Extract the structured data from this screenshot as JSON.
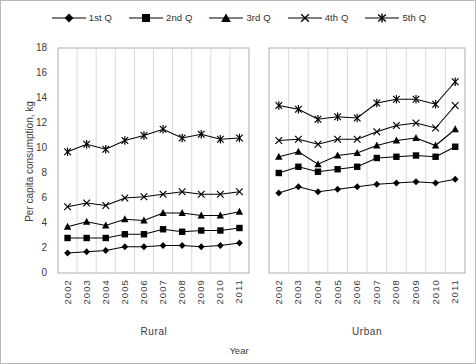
{
  "chart_data": {
    "type": "line",
    "title": "",
    "xlabel": "Year",
    "ylabel": "Per capita consumption, kg",
    "ylim": [
      0,
      18
    ],
    "ytick_values": [
      0,
      2,
      4,
      6,
      8,
      10,
      12,
      14,
      16,
      18
    ],
    "ytick_labels": [
      "0",
      "2",
      "4",
      "6",
      "8",
      "10",
      "12",
      "14",
      "16",
      "18"
    ],
    "grid": "vertical-only",
    "legend_position": "top-center",
    "groups": [
      {
        "name": "Rural",
        "categories": [
          "2002",
          "2003",
          "2004",
          "2005",
          "2006",
          "2007",
          "2008",
          "2009",
          "2010",
          "2011"
        ]
      },
      {
        "name": "Urban",
        "categories": [
          "2002",
          "2003",
          "2004",
          "2005",
          "2006",
          "2007",
          "2008",
          "2009",
          "2010",
          "2011"
        ]
      }
    ],
    "x": [
      "2002",
      "2003",
      "2004",
      "2005",
      "2006",
      "2007",
      "2008",
      "2009",
      "2010",
      "2011",
      "2002",
      "2003",
      "2004",
      "2005",
      "2006",
      "2007",
      "2008",
      "2009",
      "2010",
      "2011"
    ],
    "series": [
      {
        "name": "1st Q",
        "marker": "diamond",
        "rural": [
          1.6,
          1.7,
          1.8,
          2.1,
          2.1,
          2.2,
          2.2,
          2.1,
          2.2,
          2.4
        ],
        "urban": [
          6.4,
          6.9,
          6.5,
          6.7,
          6.9,
          7.1,
          7.2,
          7.3,
          7.2,
          7.5
        ],
        "values": [
          1.6,
          1.7,
          1.8,
          2.1,
          2.1,
          2.2,
          2.2,
          2.1,
          2.2,
          2.4,
          6.4,
          6.9,
          6.5,
          6.7,
          6.9,
          7.1,
          7.2,
          7.3,
          7.2,
          7.5
        ]
      },
      {
        "name": "2nd Q",
        "marker": "square",
        "rural": [
          2.8,
          2.8,
          2.8,
          3.1,
          3.1,
          3.5,
          3.3,
          3.4,
          3.4,
          3.6
        ],
        "urban": [
          8.0,
          8.5,
          8.1,
          8.3,
          8.5,
          9.2,
          9.3,
          9.4,
          9.3,
          10.1
        ],
        "values": [
          2.8,
          2.8,
          2.8,
          3.1,
          3.1,
          3.5,
          3.3,
          3.4,
          3.4,
          3.6,
          8.0,
          8.5,
          8.1,
          8.3,
          8.5,
          9.2,
          9.3,
          9.4,
          9.3,
          10.1
        ]
      },
      {
        "name": "3rd Q",
        "marker": "triangle",
        "rural": [
          3.7,
          4.1,
          3.8,
          4.3,
          4.2,
          4.8,
          4.8,
          4.6,
          4.6,
          4.9
        ],
        "urban": [
          9.3,
          9.7,
          8.7,
          9.4,
          9.6,
          10.2,
          10.6,
          10.8,
          10.2,
          11.5
        ],
        "values": [
          3.7,
          4.1,
          3.8,
          4.3,
          4.2,
          4.8,
          4.8,
          4.6,
          4.6,
          4.9,
          9.3,
          9.7,
          8.7,
          9.4,
          9.6,
          10.2,
          10.6,
          10.8,
          10.2,
          11.5
        ]
      },
      {
        "name": "4th Q",
        "marker": "x",
        "rural": [
          5.3,
          5.6,
          5.4,
          6.0,
          6.1,
          6.3,
          6.5,
          6.3,
          6.3,
          6.5
        ],
        "urban": [
          10.6,
          10.7,
          10.3,
          10.7,
          10.7,
          11.3,
          11.8,
          12.0,
          11.6,
          13.4
        ],
        "values": [
          5.3,
          5.6,
          5.4,
          6.0,
          6.1,
          6.3,
          6.5,
          6.3,
          6.3,
          6.5,
          10.6,
          10.7,
          10.3,
          10.7,
          10.7,
          11.3,
          11.8,
          12.0,
          11.6,
          13.4
        ]
      },
      {
        "name": "5th Q",
        "marker": "asterisk",
        "rural": [
          9.7,
          10.3,
          9.9,
          10.6,
          11.0,
          11.5,
          10.8,
          11.1,
          10.7,
          10.8
        ],
        "urban": [
          13.4,
          13.1,
          12.3,
          12.5,
          12.4,
          13.6,
          13.9,
          13.9,
          13.5,
          15.3
        ],
        "values": [
          9.7,
          10.3,
          9.9,
          10.6,
          11.0,
          11.5,
          10.8,
          11.1,
          10.7,
          10.8,
          13.4,
          13.1,
          12.3,
          12.5,
          12.4,
          13.6,
          13.9,
          13.9,
          13.5,
          15.3
        ]
      }
    ]
  },
  "legend": {
    "items": [
      {
        "label": "1st Q",
        "marker": "diamond"
      },
      {
        "label": "2nd Q",
        "marker": "square"
      },
      {
        "label": "3rd Q",
        "marker": "triangle"
      },
      {
        "label": "4th Q",
        "marker": "x"
      },
      {
        "label": "5th Q",
        "marker": "asterisk"
      }
    ]
  },
  "axes": {
    "y_title": "Per capita consumption, kg",
    "x_title": "Year",
    "y_labels": [
      "18",
      "16",
      "14",
      "12",
      "10",
      "8",
      "6",
      "4",
      "2",
      "0"
    ],
    "rural_years": [
      "2002",
      "2003",
      "2004",
      "2005",
      "2006",
      "2007",
      "2008",
      "2009",
      "2010",
      "2011"
    ],
    "urban_years": [
      "2002",
      "2003",
      "2004",
      "2005",
      "2006",
      "2007",
      "2008",
      "2009",
      "2010",
      "2011"
    ],
    "group_rural": "Rural",
    "group_urban": "Urban"
  },
  "colors": {
    "series": "#000000",
    "grid": "#d9d9d9",
    "axis": "#9a9a9a",
    "text": "#3a3a3a",
    "background": "#ffffff"
  }
}
